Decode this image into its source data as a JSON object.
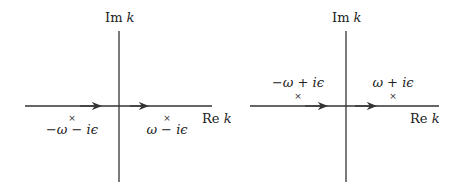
{
  "diagrams": [
    {
      "name": "retarded-contour",
      "im_axis_label": "Im",
      "im_axis_var": "k",
      "re_axis_label": "Re",
      "re_axis_var": "k",
      "poles": [
        {
          "marker": "×",
          "label": "−ω − iϵ",
          "position": "below-axis-left"
        },
        {
          "marker": "×",
          "label": "ω − iϵ",
          "position": "below-axis-right"
        }
      ]
    },
    {
      "name": "advanced-contour",
      "im_axis_label": "Im",
      "im_axis_var": "k",
      "re_axis_label": "Re",
      "re_axis_var": "k",
      "poles": [
        {
          "marker": "×",
          "label": "−ω + iϵ",
          "position": "above-axis-left"
        },
        {
          "marker": "×",
          "label": "ω + iϵ",
          "position": "above-axis-right"
        }
      ]
    }
  ],
  "colors": {
    "line": "#333333",
    "text": "#222222",
    "background": "#ffffff"
  }
}
